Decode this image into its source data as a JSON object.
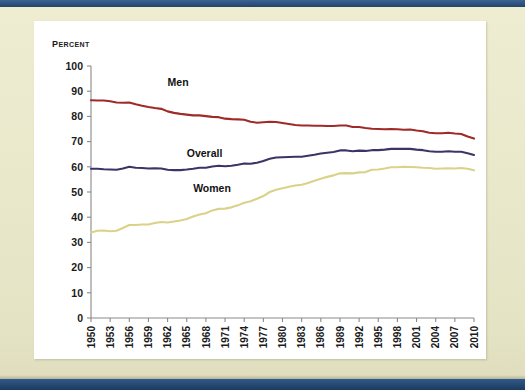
{
  "page": {
    "background_color": "#e9e8cb",
    "band_color": "#2c5280",
    "panel_color": "#ffffff"
  },
  "chart_data": {
    "type": "line",
    "title": "Percent",
    "xlabel": "",
    "ylabel": "Percent",
    "ylim": [
      0,
      100
    ],
    "xlim": [
      1950,
      2010
    ],
    "ytick_step": 10,
    "xtick_step": 3,
    "grid": false,
    "legend": "inline-labels",
    "y_ticks": [
      0,
      10,
      20,
      30,
      40,
      50,
      60,
      70,
      80,
      90,
      100
    ],
    "x_ticks": [
      1950,
      1953,
      1956,
      1959,
      1962,
      1965,
      1968,
      1971,
      1974,
      1977,
      1980,
      1983,
      1986,
      1989,
      1992,
      1995,
      1998,
      2001,
      2004,
      2007,
      2010
    ],
    "x": [
      1950,
      1951,
      1952,
      1953,
      1954,
      1955,
      1956,
      1957,
      1958,
      1959,
      1960,
      1961,
      1962,
      1963,
      1964,
      1965,
      1966,
      1967,
      1968,
      1969,
      1970,
      1971,
      1972,
      1973,
      1974,
      1975,
      1976,
      1977,
      1978,
      1979,
      1980,
      1981,
      1982,
      1983,
      1984,
      1985,
      1986,
      1987,
      1988,
      1989,
      1990,
      1991,
      1992,
      1993,
      1994,
      1995,
      1996,
      1997,
      1998,
      1999,
      2000,
      2001,
      2002,
      2003,
      2004,
      2005,
      2006,
      2007,
      2008,
      2009,
      2010
    ],
    "series": [
      {
        "name": "Men",
        "color": "#9e2b28",
        "label_x": 1962,
        "label_y": 92,
        "values": [
          86.4,
          86.3,
          86.3,
          86.0,
          85.5,
          85.4,
          85.5,
          84.8,
          84.2,
          83.7,
          83.3,
          83.0,
          82.0,
          81.4,
          81.0,
          80.7,
          80.4,
          80.4,
          80.1,
          79.8,
          79.7,
          79.1,
          78.9,
          78.8,
          78.7,
          77.9,
          77.5,
          77.7,
          77.9,
          77.8,
          77.4,
          77.0,
          76.6,
          76.4,
          76.4,
          76.3,
          76.3,
          76.2,
          76.2,
          76.4,
          76.4,
          75.8,
          75.8,
          75.4,
          75.1,
          75.0,
          74.9,
          75.0,
          74.9,
          74.7,
          74.8,
          74.4,
          74.1,
          73.5,
          73.3,
          73.3,
          73.5,
          73.2,
          73.0,
          72.0,
          71.2
        ]
      },
      {
        "name": "Overall",
        "color": "#3a3566",
        "label_x": 1965,
        "label_y": 64,
        "values": [
          59.2,
          59.2,
          59.0,
          58.9,
          58.8,
          59.3,
          60.0,
          59.6,
          59.5,
          59.3,
          59.4,
          59.3,
          58.8,
          58.7,
          58.7,
          58.9,
          59.2,
          59.6,
          59.6,
          60.1,
          60.4,
          60.2,
          60.4,
          60.8,
          61.3,
          61.2,
          61.6,
          62.3,
          63.2,
          63.7,
          63.8,
          63.9,
          64.0,
          64.0,
          64.4,
          64.8,
          65.3,
          65.6,
          65.9,
          66.5,
          66.5,
          66.2,
          66.4,
          66.3,
          66.6,
          66.6,
          66.8,
          67.1,
          67.1,
          67.1,
          67.1,
          66.8,
          66.6,
          66.2,
          66.0,
          66.0,
          66.2,
          66.0,
          66.0,
          65.4,
          64.7
        ]
      },
      {
        "name": "Women",
        "color": "#dbd28a",
        "label_x": 1966,
        "label_y": 50,
        "values": [
          33.9,
          34.6,
          34.7,
          34.4,
          34.6,
          35.7,
          36.9,
          36.9,
          37.1,
          37.1,
          37.7,
          38.1,
          37.9,
          38.3,
          38.7,
          39.3,
          40.3,
          41.1,
          41.6,
          42.7,
          43.3,
          43.4,
          43.9,
          44.7,
          45.7,
          46.3,
          47.3,
          48.4,
          50.0,
          50.9,
          51.5,
          52.1,
          52.6,
          52.9,
          53.6,
          54.5,
          55.3,
          56.0,
          56.6,
          57.4,
          57.5,
          57.4,
          57.8,
          57.9,
          58.8,
          58.9,
          59.3,
          59.8,
          59.8,
          60.0,
          59.9,
          59.8,
          59.6,
          59.5,
          59.2,
          59.3,
          59.4,
          59.3,
          59.5,
          59.2,
          58.6
        ]
      }
    ]
  }
}
